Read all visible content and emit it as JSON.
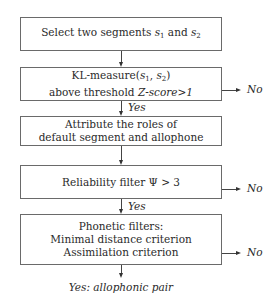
{
  "flowchart": {
    "steps": [
      {
        "line1_pre": "Select two segments ",
        "s1": "s",
        "s1_sub": "1",
        "mid": " and ",
        "s2": "s",
        "s2_sub": "2"
      },
      {
        "line1_pre": "KL-measure(",
        "s1": "s",
        "s1_sub": "1",
        "sep": ", ",
        "s2": "s",
        "s2_sub": "2",
        "line1_post": ")",
        "line2_pre": "above threshold ",
        "line2_em": "Z-score>1"
      },
      {
        "line1": "Attribute the roles of",
        "line2": "default segment and allophone"
      },
      {
        "line1": "Reliability filter Ψ > 3"
      },
      {
        "line1": "Phonetic filters:",
        "line2": "Minimal distance criterion",
        "line3": "Assimilation criterion"
      }
    ],
    "yes_label": "Yes",
    "no_label": "No",
    "final_label": "Yes: allophonic pair"
  },
  "colors": {
    "line": "#444444",
    "border": "#6a6a6a",
    "text": "#2a2a2a"
  }
}
